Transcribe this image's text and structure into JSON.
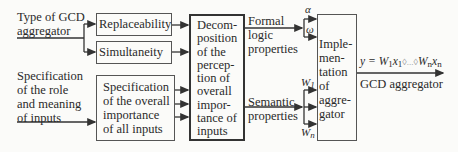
{
  "inputs": {
    "type_label_line1": "Type of GCD",
    "type_label_line2": "aggregator",
    "spec_role_lines": [
      "Specification",
      "of the role",
      "and meaning",
      "of inputs"
    ]
  },
  "boxes": {
    "replaceability": "Replaceability",
    "simultaneity": "Simultaneity",
    "overall_importance": [
      "Specification",
      "of the overall",
      "importance",
      "of all inputs"
    ],
    "decomposition": [
      "Decom-",
      "position",
      "of the",
      "percep-",
      "tion of",
      "overall",
      "impor-",
      "tance of",
      "inputs"
    ],
    "implementation": [
      "Imple-",
      "men-",
      "tation",
      "of",
      "aggre-",
      "gator"
    ]
  },
  "properties": {
    "formal": [
      "Formal",
      "logic",
      "properties"
    ],
    "semantic": [
      "Semantic",
      "properties"
    ]
  },
  "parameters": {
    "alpha": "α",
    "omega": "ω",
    "w1": "W",
    "w1_sub": "1",
    "wn": "W",
    "wn_sub": "n"
  },
  "output": {
    "formula_y": "y = ",
    "formula_w1": "W",
    "formula_w1_sub": "1",
    "formula_x1": "x",
    "formula_x1_sub": "1",
    "formula_mid": "◊...◊",
    "formula_wn": "W",
    "formula_wn_sub": "n",
    "formula_xn": "x",
    "formula_xn_sub": "n",
    "label": "GCD aggregator"
  },
  "colors": {
    "line": "#333333",
    "background": "#fbfbf9"
  }
}
